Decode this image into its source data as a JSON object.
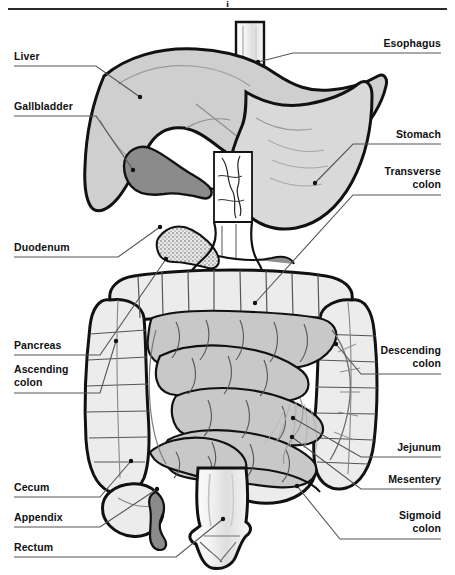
{
  "figure": {
    "title_fragment": "i",
    "view": "anterior abdominal view",
    "background_color": "#ffffff",
    "ink_color": "#111111"
  },
  "palette": {
    "outline": "#111111",
    "liver_fill": "#cfcfcf",
    "gallbladder_fill": "#8b8b8b",
    "stomach_fill": "#d9d9d9",
    "colon_fill": "#ececec",
    "small_intestine_fill": "#c8c8c8",
    "pancreas_fill": "#e6e6e6",
    "rectum_fill": "#f2f2f2",
    "esophagus_fill": "#f4f4f4",
    "appendix_fill": "#8b8b8b",
    "leader_line": "#555555",
    "rule": "#7a7a7a"
  },
  "labels_left": [
    {
      "id": "liver",
      "text": "Liver",
      "x": 14,
      "y": 50,
      "rule_y": 66,
      "rule_x2": 96,
      "point_x": 140,
      "point_y": 97
    },
    {
      "id": "gallbladder",
      "text": "Gallbladder",
      "x": 14,
      "y": 100,
      "rule_y": 116,
      "rule_x2": 96,
      "point_x": 133,
      "point_y": 170
    },
    {
      "id": "duodenum",
      "text": "Duodenum",
      "x": 14,
      "y": 241,
      "rule_y": 257,
      "rule_x2": 118,
      "point_x": 160,
      "point_y": 227
    },
    {
      "id": "pancreas",
      "text": "Pancreas",
      "x": 14,
      "y": 339,
      "rule_y": 355,
      "rule_x2": 100,
      "point_x": 166,
      "point_y": 259
    },
    {
      "id": "ascending-colon",
      "text": "Ascending\ncolon",
      "x": 14,
      "y": 363,
      "rule_y": 393,
      "rule_x2": 100,
      "point_x": 116,
      "point_y": 341
    },
    {
      "id": "cecum",
      "text": "Cecum",
      "x": 14,
      "y": 481,
      "rule_y": 497,
      "rule_x2": 100,
      "point_x": 131,
      "point_y": 461
    },
    {
      "id": "appendix",
      "text": "Appendix",
      "x": 14,
      "y": 511,
      "rule_y": 527,
      "rule_x2": 100,
      "point_x": 157,
      "point_y": 489
    },
    {
      "id": "rectum",
      "text": "Rectum",
      "x": 14,
      "y": 541,
      "rule_y": 557,
      "rule_x2": 176,
      "point_x": 223,
      "point_y": 519
    }
  ],
  "labels_right": [
    {
      "id": "esophagus",
      "text": "Esophagus",
      "x": 441,
      "y": 37,
      "rule_y": 53,
      "rule_x2": 293,
      "point_x": 258,
      "point_y": 62
    },
    {
      "id": "stomach",
      "text": "Stomach",
      "x": 441,
      "y": 128,
      "rule_y": 144,
      "rule_x2": 353,
      "point_x": 315,
      "point_y": 183
    },
    {
      "id": "transverse-colon",
      "text": "Transverse\ncolon",
      "x": 441,
      "y": 165,
      "rule_y": 195,
      "rule_x2": 353,
      "point_x": 255,
      "point_y": 303
    },
    {
      "id": "descending-colon",
      "text": "Descending\ncolon",
      "x": 441,
      "y": 344,
      "rule_y": 374,
      "rule_x2": 361,
      "point_x": 336,
      "point_y": 344
    },
    {
      "id": "jejunum",
      "text": "Jejunum",
      "x": 441,
      "y": 441,
      "rule_y": 457,
      "rule_x2": 361,
      "point_x": 293,
      "point_y": 418
    },
    {
      "id": "mesentery",
      "text": "Mesentery",
      "x": 441,
      "y": 473,
      "rule_y": 489,
      "rule_x2": 361,
      "point_x": 292,
      "point_y": 437
    },
    {
      "id": "sigmoid-colon",
      "text": "Sigmoid\ncolon",
      "x": 441,
      "y": 509,
      "rule_y": 539,
      "rule_x2": 340,
      "point_x": 297,
      "point_y": 486
    }
  ]
}
